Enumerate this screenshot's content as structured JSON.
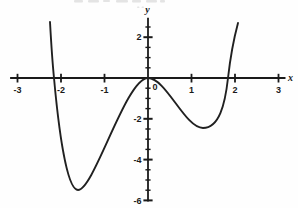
{
  "figure": {
    "background": "#fefefe",
    "axis_color": "#1a1a1a",
    "curve_color": "#202020",
    "text_color": "#1a1a1a",
    "cropped_caption_artifact": "faint illegible fragments of a cropped caption line along the top edge"
  },
  "chart_data": {
    "type": "line",
    "title": "",
    "xlabel": "x",
    "ylabel": "y",
    "grid": false,
    "legend": false,
    "x_axis": {
      "min": -3.17,
      "max": 3.16,
      "tick_step": 1,
      "tick_values": [
        -3,
        -2,
        -1,
        1,
        2,
        3
      ],
      "tick_labels": [
        "-3",
        "-2",
        "-1",
        "1",
        "2",
        "3"
      ]
    },
    "y_axis": {
      "min": -6.05,
      "max": 2.95,
      "minor_tick_step": 0.5,
      "minor_tick_top": 2.5,
      "minor_tick_bottom": -6,
      "major_tick_values": [
        2,
        -2,
        -4,
        -6
      ],
      "major_tick_labels": [
        "2",
        "-2",
        "-4",
        "-6"
      ]
    },
    "origin_label": "0",
    "key_points": {
      "x_intercepts": [
        -2.16,
        0,
        1.84
      ],
      "local_max": [
        0,
        0
      ],
      "local_minima": [
        [
          -1.6,
          -5.45
        ],
        [
          1.28,
          -2.45
        ]
      ],
      "left_endpoint": [
        -2.25,
        2.75
      ],
      "right_endpoint": [
        2.07,
        2.7
      ]
    },
    "curve_bezier": {
      "start": [
        -2.253,
        2.745
      ],
      "segments": [
        [
          [
            -2.23,
            1.863
          ],
          [
            -2.207,
            0.98
          ],
          [
            -2.161,
            0
          ]
        ],
        [
          [
            -2.069,
            -2.157
          ],
          [
            -1.885,
            -5.49
          ],
          [
            -1.609,
            -5.49
          ]
        ],
        [
          [
            -1.241,
            -5.49
          ],
          [
            -0.506,
            0
          ],
          [
            0,
            0
          ]
        ],
        [
          [
            0.414,
            0
          ],
          [
            0.851,
            -2.451
          ],
          [
            1.264,
            -2.451
          ]
        ],
        [
          [
            1.632,
            -2.451
          ],
          [
            1.77,
            -1.324
          ],
          [
            1.839,
            0
          ]
        ],
        [
          [
            1.908,
            1.324
          ],
          [
            1.977,
            1.961
          ],
          [
            2.069,
            2.696
          ]
        ]
      ]
    }
  }
}
